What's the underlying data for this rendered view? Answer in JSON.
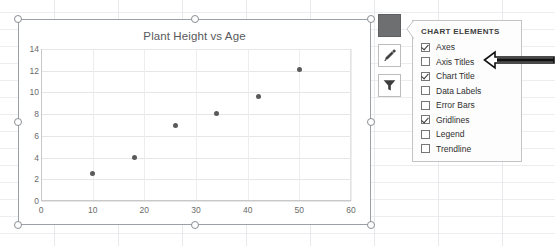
{
  "chart_data": {
    "type": "scatter",
    "title": "Plant Height vs Age",
    "xlabel": "",
    "ylabel": "",
    "xlim": [
      0,
      60
    ],
    "ylim": [
      0,
      14
    ],
    "xticks": [
      0,
      10,
      20,
      30,
      40,
      50,
      60
    ],
    "yticks": [
      0,
      2,
      4,
      6,
      8,
      10,
      12,
      14
    ],
    "grid": true,
    "legend": false,
    "series": [
      {
        "name": "Plant Height",
        "marker_color": "#5a5a5a",
        "points": [
          {
            "x": 10,
            "y": 2.5
          },
          {
            "x": 18,
            "y": 4.0
          },
          {
            "x": 26,
            "y": 7.0
          },
          {
            "x": 34,
            "y": 8.1
          },
          {
            "x": 42,
            "y": 9.6
          },
          {
            "x": 50,
            "y": 12.1
          }
        ]
      }
    ]
  },
  "side_buttons": [
    {
      "name": "chart-elements",
      "icon": "plus-icon",
      "active": true
    },
    {
      "name": "chart-styles",
      "icon": "brush-icon",
      "active": false
    },
    {
      "name": "chart-filters",
      "icon": "funnel-icon",
      "active": false
    }
  ],
  "chart_elements_panel": {
    "title": "CHART ELEMENTS",
    "items": [
      {
        "label": "Axes",
        "checked": true
      },
      {
        "label": "Axis Titles",
        "checked": false
      },
      {
        "label": "Chart Title",
        "checked": true
      },
      {
        "label": "Data Labels",
        "checked": false
      },
      {
        "label": "Error Bars",
        "checked": false
      },
      {
        "label": "Gridlines",
        "checked": true
      },
      {
        "label": "Legend",
        "checked": false
      },
      {
        "label": "Trendline",
        "checked": false
      }
    ]
  },
  "annotation": {
    "arrow": "left-arrow-pointing-to-axis-titles",
    "target": "Axis Titles"
  },
  "colors": {
    "marker": "#5a5a5a",
    "chart_border": "#9aa0a6",
    "gridline": "#e6e6e6",
    "panel_border": "#c3c3c3",
    "active_button": "#6d6f71"
  }
}
